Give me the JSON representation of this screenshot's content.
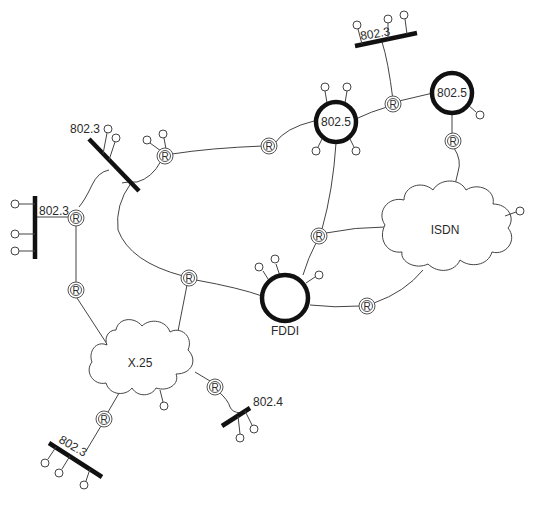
{
  "diagram": {
    "type": "network-topology",
    "colors": {
      "line": "#444444",
      "segment": "#111111",
      "background": "#ffffff"
    },
    "router_label": "R",
    "segments": [
      {
        "id": "lan-top",
        "label": "802.3",
        "kind": "bus"
      },
      {
        "id": "lan-upper-left",
        "label": "802.3",
        "kind": "bus"
      },
      {
        "id": "lan-left",
        "label": "802.3",
        "kind": "bus"
      },
      {
        "id": "lan-bottom-left",
        "label": "802.3",
        "kind": "bus"
      },
      {
        "id": "lan-bottom",
        "label": "802.4",
        "kind": "bus"
      }
    ],
    "rings": [
      {
        "id": "ring-center",
        "label": "802.5"
      },
      {
        "id": "ring-right",
        "label": "802.5"
      },
      {
        "id": "ring-fddi",
        "label": "FDDI"
      }
    ],
    "clouds": [
      {
        "id": "cloud-isdn",
        "label": "ISDN"
      },
      {
        "id": "cloud-x25",
        "label": "X.25"
      }
    ],
    "routers_count": 11
  }
}
